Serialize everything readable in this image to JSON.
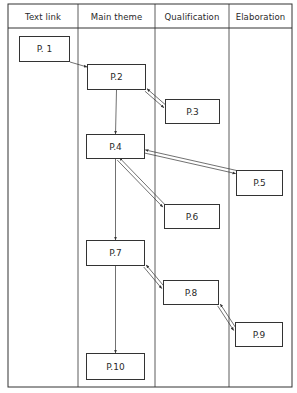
{
  "diagram": {
    "type": "swimlane-flow",
    "lanes": [
      {
        "id": "text-link",
        "label": "Text link",
        "x0": 8,
        "x1": 78
      },
      {
        "id": "main-theme",
        "label": "Main theme",
        "x0": 78,
        "x1": 155
      },
      {
        "id": "qualification",
        "label": "Qualification",
        "x0": 155,
        "x1": 229
      },
      {
        "id": "elaboration",
        "label": "Elaboration",
        "x0": 229,
        "x1": 292
      }
    ],
    "nodes": [
      {
        "id": "p1",
        "label": "P. 1",
        "lane": "text-link",
        "x": 19,
        "y": 36,
        "w": 51,
        "h": 26
      },
      {
        "id": "p2",
        "label": "P.2",
        "lane": "main-theme",
        "x": 87,
        "y": 64,
        "w": 59,
        "h": 26
      },
      {
        "id": "p3",
        "label": "P.3",
        "lane": "qualification",
        "x": 165,
        "y": 99,
        "w": 55,
        "h": 25
      },
      {
        "id": "p4",
        "label": "P.4",
        "lane": "main-theme",
        "x": 86,
        "y": 134,
        "w": 59,
        "h": 25
      },
      {
        "id": "p5",
        "label": "P.5",
        "lane": "elaboration",
        "x": 236,
        "y": 170,
        "w": 47,
        "h": 26
      },
      {
        "id": "p6",
        "label": "P.6",
        "lane": "qualification",
        "x": 164,
        "y": 204,
        "w": 56,
        "h": 25
      },
      {
        "id": "p7",
        "label": "P.7",
        "lane": "main-theme",
        "x": 86,
        "y": 240,
        "w": 59,
        "h": 26
      },
      {
        "id": "p8",
        "label": "P.8",
        "lane": "qualification",
        "x": 163,
        "y": 280,
        "w": 56,
        "h": 25
      },
      {
        "id": "p9",
        "label": "P.9",
        "lane": "elaboration",
        "x": 235,
        "y": 322,
        "w": 48,
        "h": 25
      },
      {
        "id": "p10",
        "label": "P.10",
        "lane": "main-theme",
        "x": 86,
        "y": 353,
        "w": 59,
        "h": 27
      }
    ],
    "edges": [
      {
        "from": "p1",
        "to": "p2",
        "kind": "single"
      },
      {
        "from": "p2",
        "to": "p3",
        "kind": "two-way"
      },
      {
        "from": "p2",
        "to": "p4",
        "kind": "single"
      },
      {
        "from": "p4",
        "to": "p5",
        "kind": "two-way"
      },
      {
        "from": "p4",
        "to": "p6",
        "kind": "two-way"
      },
      {
        "from": "p4",
        "to": "p7",
        "kind": "single"
      },
      {
        "from": "p7",
        "to": "p8",
        "kind": "two-way"
      },
      {
        "from": "p8",
        "to": "p9",
        "kind": "two-way"
      },
      {
        "from": "p7",
        "to": "p10",
        "kind": "single"
      }
    ],
    "colors": {
      "line": "#333333",
      "background": "#ffffff",
      "text": "#2a2a2a"
    }
  }
}
